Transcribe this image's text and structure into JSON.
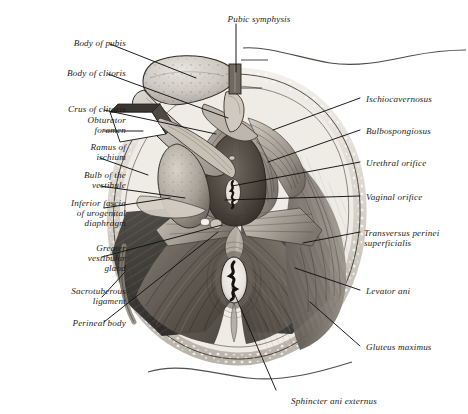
{
  "plate": {
    "title": "Female perineum — superficial dissection",
    "background_color": "#ffffff",
    "ink_color": "#1b1b1b",
    "leader_color": "#111111"
  },
  "labels_left": [
    {
      "id": "body-of-pubis",
      "text": "Body of pubis",
      "x": 22,
      "y": 38,
      "w": 104
    },
    {
      "id": "body-of-clitoris",
      "text": "Body of clitoris",
      "x": 14,
      "y": 68,
      "w": 112
    },
    {
      "id": "crus-of-clitoris",
      "text": "Crus of clitoris",
      "x": 18,
      "y": 104,
      "w": 108
    },
    {
      "id": "obturator-foramen",
      "text": "Obturator\nforamen",
      "x": 30,
      "y": 115,
      "w": 96
    },
    {
      "id": "ramus-of-ischium",
      "text": "Ramus of\nischium",
      "x": 30,
      "y": 142,
      "w": 96
    },
    {
      "id": "bulb-of-the-vestibule",
      "text": "Bulb of the\nvestibule",
      "x": 24,
      "y": 170,
      "w": 102
    },
    {
      "id": "inferior-fascia",
      "text": "Inferior fascia\nof urogenital\ndiaphragm",
      "x": 10,
      "y": 198,
      "w": 116
    },
    {
      "id": "greater-vestibular-gland",
      "text": "Greater\nvestibular\ngland",
      "x": 18,
      "y": 243,
      "w": 108
    },
    {
      "id": "sacrotuberous-ligament",
      "text": "Sacrotuberous\nligament",
      "x": 12,
      "y": 286,
      "w": 114
    },
    {
      "id": "perineal-body",
      "text": "Perineal body",
      "x": 18,
      "y": 318,
      "w": 108
    }
  ],
  "labels_right": [
    {
      "id": "ischiocavernosus",
      "text": "Ischiocavernosus",
      "x": 366,
      "y": 94,
      "w": 100
    },
    {
      "id": "bulbospongiosus",
      "text": "Bulbospongiosus",
      "x": 366,
      "y": 126,
      "w": 100
    },
    {
      "id": "urethral-orifice",
      "text": "Urethral orifice",
      "x": 366,
      "y": 158,
      "w": 100
    },
    {
      "id": "vaginal-orifice",
      "text": "Vaginal orifice",
      "x": 366,
      "y": 192,
      "w": 100
    },
    {
      "id": "transversus-perinei",
      "text": "Transversus perinei\nsuperficialis",
      "x": 364,
      "y": 228,
      "w": 104
    },
    {
      "id": "levator-ani",
      "text": "Levator ani",
      "x": 366,
      "y": 286,
      "w": 100
    },
    {
      "id": "gluteus-maximus",
      "text": "Gluteus maximus",
      "x": 366,
      "y": 342,
      "w": 100
    }
  ],
  "labels_top": [
    {
      "id": "pubic-symphysis",
      "text": "Pubic symphysis",
      "x": 212,
      "y": 14,
      "w": 94
    }
  ],
  "labels_bottom": [
    {
      "id": "sphincter-ani-externus",
      "text": "Sphincter ani externus",
      "x": 268,
      "y": 396,
      "w": 132
    }
  ],
  "leaders_left": [
    {
      "id": "leader-body-of-pubis",
      "path": "M 110,44 L 196,78"
    },
    {
      "id": "leader-body-of-clitoris",
      "path": "M 108,74 L 228,118"
    },
    {
      "id": "leader-crus-of-clitoris",
      "path": "M 104,110 L 216,134"
    },
    {
      "id": "leader-obturator-foramen",
      "path": "M 104,131 L 143,131"
    },
    {
      "id": "leader-ramus-of-ischium",
      "path": "M 100,158 L 148,175"
    },
    {
      "id": "leader-bulb-of-vestibule",
      "path": "M 100,186 L 185,198"
    },
    {
      "id": "leader-inferior-fascia",
      "path": "M 104,208 L 170,198"
    },
    {
      "id": "leader-greater-vestibular",
      "path": "M 102,257 L 222,225"
    },
    {
      "id": "leader-sacrotuberous",
      "path": "M 102,297 L 125,272"
    },
    {
      "id": "leader-perineal-body",
      "path": "M 104,322 L 218,232"
    }
  ],
  "leaders_right": [
    {
      "id": "leader-ischiocavernosus",
      "path": "M 360,98  L 273,130"
    },
    {
      "id": "leader-bulbospongiosus",
      "path": "M 360,130 L 268,162"
    },
    {
      "id": "leader-urethral-orifice",
      "path": "M 360,162 L 232,186"
    },
    {
      "id": "leader-vaginal-orifice",
      "path": "M 360,196 L 225,200"
    },
    {
      "id": "leader-transversus",
      "path": "M 360,232 L 303,243"
    },
    {
      "id": "leader-levator-ani",
      "path": "M 360,290 L 295,268"
    },
    {
      "id": "leader-gluteus-maximus",
      "path": "M 360,346 L 310,302"
    }
  ],
  "leaders_top": [
    {
      "id": "leader-pubic-symphysis",
      "path": "M 236,24 L 236,72"
    }
  ],
  "leaders_bottom": [
    {
      "id": "leader-sphincter-ani",
      "path": "M 276,390 L 232,288"
    }
  ]
}
